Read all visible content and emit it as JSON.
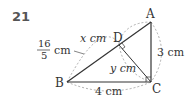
{
  "problem_number": "21",
  "vertices": {
    "A": "A",
    "B": "B",
    "C": "C",
    "D": "D"
  },
  "labels": {
    "x": "x cm",
    "y": "y cm",
    "bd_num": "16",
    "bd_den": "5",
    "bd_unit": "cm",
    "bc": "4 cm",
    "ac": "3 cm"
  },
  "colors": {
    "line": "#333333",
    "dashed": "#999999",
    "number": "#555555"
  }
}
